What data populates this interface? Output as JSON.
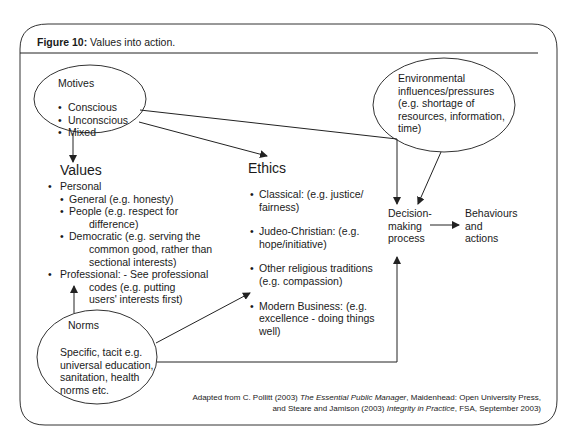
{
  "figure": {
    "label": "Figure 10:",
    "title": "Values into action."
  },
  "motives": {
    "heading": "Motives",
    "items": [
      "Conscious",
      "Unconscious",
      "Mixed"
    ]
  },
  "environment": {
    "lines": [
      "Environmental",
      "influences/pressures",
      "(e.g. shortage of",
      "resources, information,",
      "time)"
    ]
  },
  "values": {
    "heading": "Values",
    "personal": "Personal",
    "general": "General (e.g. honesty)",
    "people_1": "People (e.g. respect for",
    "people_2": "difference)",
    "democratic_1": "Democratic (e.g. serving the",
    "democratic_2": "common good, rather than",
    "democratic_3": "sectional interests)",
    "professional_1": "Professional: - See professional",
    "professional_2": "codes (e.g. putting",
    "professional_3": "users' interests first)"
  },
  "ethics": {
    "heading": "Ethics",
    "classical_1": "Classical: (e.g. justice/",
    "classical_2": "fairness)",
    "judeo_1": "Judeo-Christian: (e.g.",
    "judeo_2": "hope/initiative)",
    "other_1": "Other religious traditions",
    "other_2": "(e.g. compassion)",
    "modern_1": "Modern Business: (e.g.",
    "modern_2": "excellence - doing things",
    "modern_3": "well)"
  },
  "norms": {
    "heading": "Norms",
    "lines": [
      "Specific, tacit e.g.",
      "universal education,",
      "sanitation, health",
      "norms etc."
    ]
  },
  "decision": {
    "lines": [
      "Decision-",
      "making",
      "process"
    ]
  },
  "behaviours": {
    "lines": [
      "Behaviours",
      "and",
      "actions"
    ]
  },
  "footer": {
    "line1_pre": "Adapted from C. Pollitt (2003) ",
    "line1_italic": "The Essential Public Manager",
    "line1_post": ", Maidenhead: Open University Press,",
    "line2_pre": "and Steare and Jamison (2003) ",
    "line2_italic": "Integrity in Practice",
    "line2_post": ", FSA, September 2003)"
  },
  "colors": {
    "stroke": "#333333",
    "text": "#1a1a1a",
    "background": "#ffffff"
  }
}
